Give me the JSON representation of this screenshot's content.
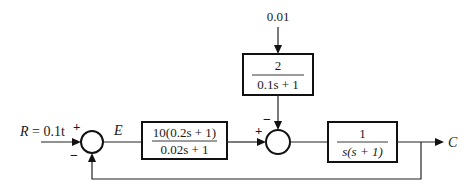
{
  "diagram": {
    "type": "control-block-diagram",
    "input": {
      "label": "R = 0.1t",
      "symbol": "R",
      "expr": "0.1t"
    },
    "disturbance": {
      "label": "0.01"
    },
    "error_signal": {
      "label": "E"
    },
    "output": {
      "label": "C"
    },
    "blocks": [
      {
        "name": "controller",
        "numerator": "10(0.2s + 1)",
        "denominator": "0.02s + 1"
      },
      {
        "name": "disturbance-filter",
        "numerator": "2",
        "denominator": "0.1s + 1"
      },
      {
        "name": "plant",
        "numerator": "1",
        "denominator": "s(s + 1)"
      }
    ],
    "summing_junctions": [
      {
        "name": "error-junction",
        "signs": {
          "left": "+",
          "bottom": "−"
        }
      },
      {
        "name": "disturbance-junction",
        "signs": {
          "left": "+",
          "top": "−"
        }
      }
    ],
    "feedback": {
      "type": "unity"
    }
  }
}
